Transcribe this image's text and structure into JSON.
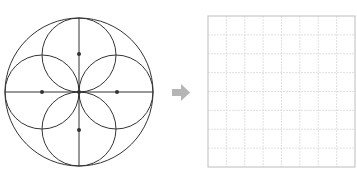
{
  "figure": {
    "description": "Geometric construction: a large circle containing four overlapping circles arranged around the center (flower pattern), with horizontal and vertical diameters; an arrow points to an empty 8x8 grid for copying the pattern.",
    "pattern": {
      "outer_circle": {
        "cx": 79,
        "cy": 92,
        "r": 74
      },
      "inner_circles": [
        {
          "name": "top",
          "cx": 79,
          "cy": 55,
          "r": 37
        },
        {
          "name": "right",
          "cx": 116,
          "cy": 92,
          "r": 37
        },
        {
          "name": "bottom",
          "cx": 79,
          "cy": 129,
          "r": 37
        },
        {
          "name": "left",
          "cx": 42,
          "cy": 92,
          "r": 37
        }
      ],
      "center_points": [
        {
          "cx": 79,
          "cy": 54
        },
        {
          "cx": 117,
          "cy": 92
        },
        {
          "cx": 79,
          "cy": 130
        },
        {
          "cx": 42,
          "cy": 92
        },
        {
          "cx": 79,
          "cy": 92
        }
      ],
      "stroke_color": "#333333"
    },
    "arrow": {
      "direction": "right",
      "color": "#b5b5b5"
    },
    "grid": {
      "rows": 8,
      "cols": 8,
      "x": 208,
      "y": 16,
      "width": 147,
      "height": 151,
      "border_color": "#bdbdbd",
      "line_color": "#d8d8d8"
    }
  }
}
